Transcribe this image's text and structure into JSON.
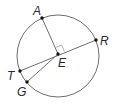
{
  "diagram": {
    "type": "circle-geometry",
    "circle": {
      "center": [
        58,
        56
      ],
      "radius": 41
    },
    "points": {
      "A": {
        "label": "A",
        "x": 42,
        "y": 18
      },
      "R": {
        "label": "R",
        "x": 96,
        "y": 40
      },
      "E": {
        "label": "E",
        "x": 58,
        "y": 54
      },
      "T": {
        "label": "T",
        "x": 20,
        "y": 71
      },
      "G": {
        "label": "G",
        "x": 27,
        "y": 82
      }
    },
    "segments": [
      {
        "from": "A",
        "to": "E"
      },
      {
        "from": "T",
        "to": "R"
      },
      {
        "from": "E",
        "to": "G"
      }
    ],
    "right_angle": {
      "at": "E",
      "between": [
        "A",
        "R"
      ]
    },
    "colors": {
      "stroke": "#6e6e6e",
      "point": "#111111",
      "label": "#2a2a2a"
    }
  }
}
